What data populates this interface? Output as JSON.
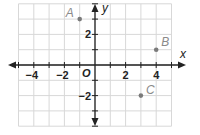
{
  "chart_data": {
    "type": "scatter",
    "title": "",
    "xlabel": "x",
    "ylabel": "y",
    "origin_label": "O",
    "xlim": [
      -5,
      5
    ],
    "ylim": [
      -4,
      4
    ],
    "grid": true,
    "x_ticks": [
      -4,
      -2,
      2,
      4
    ],
    "y_ticks": [
      2,
      -2
    ],
    "x_tick_labels": [
      "−4",
      "−2",
      "2",
      "4"
    ],
    "y_tick_labels": [
      "2",
      "−2"
    ],
    "points": [
      {
        "label": "A",
        "x": -1,
        "y": 3
      },
      {
        "label": "B",
        "x": 4,
        "y": 1
      },
      {
        "label": "C",
        "x": 3,
        "y": -2
      }
    ],
    "colors": {
      "grid": "#d8d8d8",
      "axis": "#222222",
      "point": "#7a7a7a",
      "point_label": "#8a8a8a"
    }
  }
}
